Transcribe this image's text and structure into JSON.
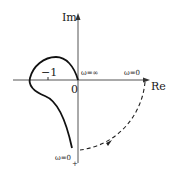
{
  "diagram": {
    "type": "nyquist-plot",
    "axes": {
      "real_label": "Re",
      "imag_label": "Im",
      "origin_label": "0"
    },
    "annotations": {
      "minus_one": "−1",
      "omega_inf": "ω=∞",
      "omega_zero_real": "ω=0",
      "omega_zero_plus_main": "ω=0",
      "omega_zero_plus_sub": "+"
    },
    "colors": {
      "curve": "#111111",
      "axis": "#555555"
    }
  }
}
